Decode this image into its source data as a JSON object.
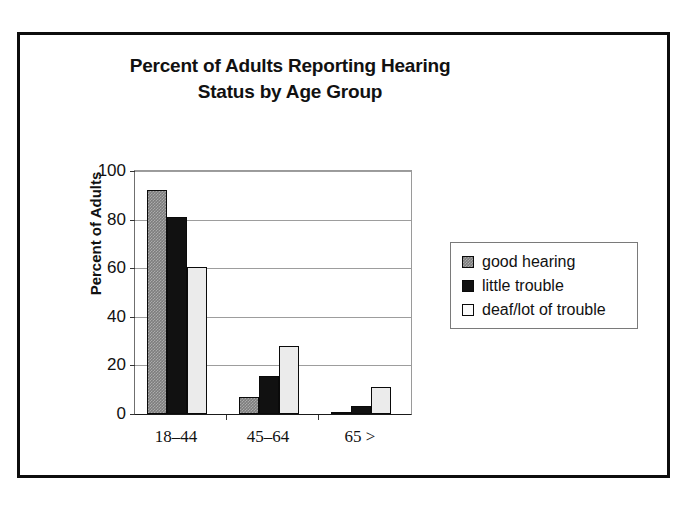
{
  "chart_data": {
    "type": "bar",
    "title": "Percent of Adults Reporting Hearing Status by Age Group",
    "title_lines": [
      "Percent of Adults Reporting Hearing",
      "Status by Age Group"
    ],
    "xlabel": "",
    "ylabel": "Percent of Adults",
    "ylim": [
      0,
      100
    ],
    "ytick_values": [
      0,
      20,
      40,
      60,
      80,
      100
    ],
    "ytick_labels": [
      "0",
      "20",
      "40",
      "60",
      "80",
      "100"
    ],
    "categories": [
      "18–44",
      "45–64",
      "65 >"
    ],
    "grid": "horizontal",
    "legend_position": "right",
    "series": [
      {
        "name": "good hearing",
        "color": "#7d7d7d",
        "values": [
          92,
          7,
          1
        ]
      },
      {
        "name": "little trouble",
        "color": "#111111",
        "values": [
          81,
          15.5,
          3.5
        ]
      },
      {
        "name": "deaf/lot of trouble",
        "color": "#ebebeb",
        "values": [
          60.5,
          28,
          11
        ]
      }
    ]
  },
  "legend": {
    "items": [
      {
        "label": "good hearing"
      },
      {
        "label": "little trouble"
      },
      {
        "label": "deaf/lot of trouble"
      }
    ]
  }
}
